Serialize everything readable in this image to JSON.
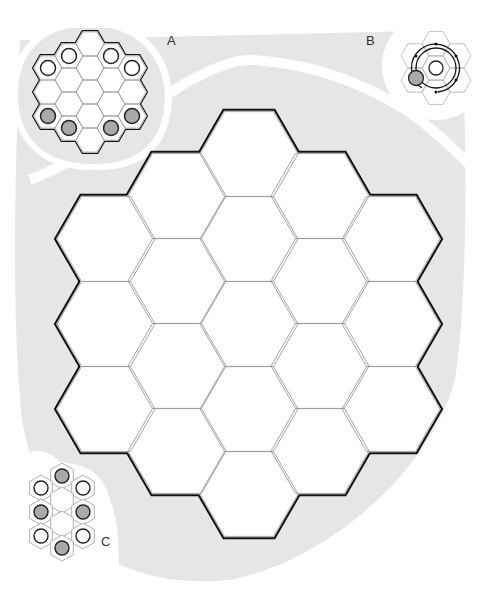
{
  "colors": {
    "background": "#ffffff",
    "backdrop": "#e6e6e6",
    "divider": "#ffffff",
    "cell_fill": "#ffffff",
    "cell_line": "#9a9a9a",
    "border": "#111111",
    "stone_white": "#ffffff",
    "stone_gray": "#a9a9a9",
    "stone_outline": "#222222",
    "label": "#333333"
  },
  "labels": {
    "a": "A",
    "b": "B",
    "c": "C"
  },
  "main_board": {
    "name": "19-cell hexagonal board",
    "orientation": "flat-top",
    "radius": 49,
    "columns": [
      {
        "x": 106,
        "ys": [
          239,
          324,
          409
        ]
      },
      {
        "x": 177,
        "ys": [
          196,
          281,
          366,
          451
        ]
      },
      {
        "x": 249,
        "ys": [
          154,
          239,
          324,
          409,
          494
        ]
      },
      {
        "x": 320,
        "ys": [
          196,
          281,
          366,
          451
        ]
      },
      {
        "x": 391,
        "ys": [
          239,
          324,
          409
        ]
      }
    ]
  },
  "diagram_a": {
    "label_pos": [
      172,
      40
    ],
    "orientation": "flat-top",
    "radius": 14,
    "columns": [
      {
        "x": 48,
        "ys": [
          68,
          92,
          116
        ]
      },
      {
        "x": 69,
        "ys": [
          56,
          80,
          104,
          128
        ]
      },
      {
        "x": 90,
        "ys": [
          44,
          68,
          92,
          116,
          140
        ]
      },
      {
        "x": 111,
        "ys": [
          56,
          80,
          104,
          128
        ]
      },
      {
        "x": 132,
        "ys": [
          68,
          92,
          116
        ]
      }
    ],
    "stones": [
      {
        "x": 48,
        "y": 68,
        "color": "white"
      },
      {
        "x": 69,
        "y": 56,
        "color": "white"
      },
      {
        "x": 111,
        "y": 56,
        "color": "white"
      },
      {
        "x": 132,
        "y": 68,
        "color": "white"
      },
      {
        "x": 48,
        "y": 116,
        "color": "gray"
      },
      {
        "x": 69,
        "y": 128,
        "color": "gray"
      },
      {
        "x": 111,
        "y": 128,
        "color": "gray"
      },
      {
        "x": 132,
        "y": 116,
        "color": "gray"
      }
    ]
  },
  "diagram_b": {
    "label_pos": [
      371,
      40
    ],
    "center": [
      436,
      68
    ],
    "hex_radius": 14,
    "center_stone": "white",
    "moving_stone": {
      "x": 416,
      "y": 78,
      "color": "gray"
    },
    "path_description": "double circular arrow path around the center cell"
  },
  "diagram_c": {
    "label_pos": [
      104,
      536
    ],
    "orientation": "pointy-top",
    "radius": 12.5,
    "cells": [
      {
        "x": 62,
        "y": 476,
        "stone": "gray"
      },
      {
        "x": 41,
        "y": 488,
        "stone": "white"
      },
      {
        "x": 83,
        "y": 488,
        "stone": "white"
      },
      {
        "x": 62,
        "y": 500,
        "stone": null
      },
      {
        "x": 41,
        "y": 512,
        "stone": "gray"
      },
      {
        "x": 83,
        "y": 512,
        "stone": "gray"
      },
      {
        "x": 62,
        "y": 524,
        "stone": null
      },
      {
        "x": 41,
        "y": 536,
        "stone": "white"
      },
      {
        "x": 83,
        "y": 536,
        "stone": "white"
      },
      {
        "x": 62,
        "y": 548,
        "stone": "gray"
      }
    ]
  }
}
